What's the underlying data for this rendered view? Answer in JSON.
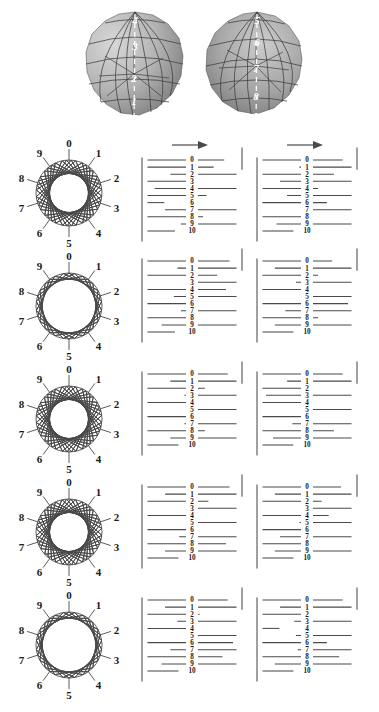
{
  "figure": {
    "width": 379,
    "height": 712,
    "background": "#ffffff",
    "line_color": "#4a4a4a",
    "label_color": "#1a1a1a",
    "sphere_label_color": "#ffffff"
  },
  "spheres": {
    "count": 2,
    "left": {
      "name": "polyhedron-left",
      "meridian_labels": [
        "4",
        "3",
        "2",
        "1",
        "0"
      ],
      "shading_light": "#cfcfcf",
      "shading_dark": "#8f8f8f"
    },
    "right": {
      "name": "polyhedron-right",
      "meridian_labels": [
        "5",
        "6",
        "7",
        "8",
        "9"
      ],
      "shading_light": "#c4c4c4",
      "shading_dark": "#7e7e7e"
    }
  },
  "circle_labels": [
    "0",
    "1",
    "2",
    "3",
    "4",
    "5",
    "6",
    "7",
    "8",
    "9"
  ],
  "maze_row_labels": [
    "0",
    "1",
    "2",
    "3",
    "4",
    "5",
    "6",
    "7",
    "8",
    "9",
    "10"
  ],
  "arrow": {
    "direction": "right",
    "shown_in_row": 1,
    "label": ""
  },
  "rows": [
    {
      "index": 1,
      "circle": {
        "name": "chord-circle-row1",
        "chord_step": 3,
        "description": "ten points 0-9 joined by chords of span 3, dense diamond lattice"
      },
      "maze_a": {
        "name": "meander-row1-col1",
        "row_end_x": [
          0.86,
          0.74,
          0.74,
          0.56,
          0.92,
          0.66,
          0.18,
          0.8,
          0.62,
          0.62,
          0.3
        ],
        "row_side": [
          "L",
          "L",
          "R",
          "L",
          "R",
          "L",
          "L",
          "R",
          "L",
          "R",
          "L"
        ]
      },
      "maze_b": {
        "name": "meander-row1-col2",
        "row_end_x": [
          0.9,
          0.58,
          0.8,
          0.8,
          0.62,
          0.72,
          0.72,
          0.5,
          0.46,
          0.84,
          0.34
        ],
        "row_side": [
          "L",
          "R",
          "L",
          "R",
          "L",
          "R",
          "L",
          "R",
          "L",
          "R",
          "L"
        ]
      }
    },
    {
      "index": 2,
      "circle": {
        "name": "chord-circle-row2",
        "chord_step": 2,
        "description": "ten points 0-9 joined by chords of span 2, open grid lattice"
      },
      "maze_a": {
        "name": "meander-row2-col1",
        "row_end_x": [
          0.92,
          0.66,
          0.78,
          0.56,
          0.88,
          0.7,
          0.56,
          0.62,
          0.44,
          0.84,
          0.3
        ],
        "row_side": [
          "L",
          "R",
          "L",
          "R",
          "L",
          "R",
          "L",
          "R",
          "L",
          "R",
          "L"
        ]
      },
      "maze_b": {
        "name": "meander-row2-col2",
        "row_end_x": [
          0.78,
          0.86,
          0.62,
          0.62,
          0.5,
          0.5,
          0.96,
          0.74,
          0.62,
          0.86,
          0.34
        ],
        "row_side": [
          "L",
          "R",
          "L",
          "R",
          "L",
          "R",
          "L",
          "R",
          "L",
          "R",
          "L"
        ]
      }
    },
    {
      "index": 3,
      "circle": {
        "name": "chord-circle-row3",
        "chord_step": 3,
        "description": "ten points 0-9 joined by chords of span 3, tilted lattice"
      },
      "maze_a": {
        "name": "meander-row3-col1",
        "row_end_x": [
          0.9,
          0.74,
          0.64,
          0.58,
          0.52,
          0.46,
          0.52,
          0.58,
          0.64,
          0.74,
          0.34
        ],
        "row_side": [
          "L",
          "R",
          "L",
          "R",
          "L",
          "R",
          "L",
          "R",
          "L",
          "R",
          "L"
        ]
      },
      "maze_b": {
        "name": "meander-row3-col2",
        "row_end_x": [
          0.9,
          0.72,
          0.56,
          0.96,
          0.52,
          0.46,
          0.52,
          0.66,
          0.8,
          0.88,
          0.34
        ],
        "row_side": [
          "L",
          "R",
          "L",
          "R",
          "L",
          "R",
          "L",
          "R",
          "L",
          "R",
          "L"
        ]
      }
    },
    {
      "index": 4,
      "circle": {
        "name": "chord-circle-row4",
        "chord_step": 3,
        "description": "ten points 0-9 joined by chords of span 3, diagonal lattice"
      },
      "maze_a": {
        "name": "meander-row4-col1",
        "row_end_x": [
          0.92,
          0.8,
          0.68,
          0.56,
          0.5,
          0.44,
          0.52,
          0.64,
          0.88,
          0.8,
          0.34
        ],
        "row_side": [
          "L",
          "R",
          "L",
          "R",
          "L",
          "R",
          "L",
          "R",
          "L",
          "R",
          "L"
        ]
      },
      "maze_b": {
        "name": "meander-row4-col2",
        "row_end_x": [
          0.88,
          0.86,
          0.66,
          0.54,
          0.74,
          0.58,
          0.46,
          0.8,
          0.56,
          0.86,
          0.34
        ],
        "row_side": [
          "L",
          "R",
          "L",
          "R",
          "L",
          "R",
          "L",
          "R",
          "L",
          "R",
          "L"
        ]
      }
    },
    {
      "index": 5,
      "circle": {
        "name": "chord-circle-row5",
        "chord_step": 2,
        "description": "ten points 0-9 joined by chords of span 2, open grid lattice"
      },
      "maze_a": {
        "name": "meander-row5-col1",
        "row_end_x": [
          0.9,
          0.8,
          0.58,
          0.66,
          0.54,
          0.48,
          0.96,
          0.74,
          0.84,
          0.84,
          0.34
        ],
        "row_side": [
          "L",
          "R",
          "L",
          "R",
          "L",
          "R",
          "L",
          "R",
          "L",
          "R",
          "L"
        ]
      },
      "maze_b": {
        "name": "meander-row5-col2",
        "row_end_x": [
          0.9,
          0.8,
          0.56,
          0.64,
          0.18,
          0.62,
          0.72,
          0.6,
          0.86,
          0.86,
          0.34
        ],
        "row_side": [
          "L",
          "R",
          "L",
          "R",
          "L",
          "R",
          "L",
          "R",
          "L",
          "R",
          "L"
        ]
      }
    }
  ]
}
